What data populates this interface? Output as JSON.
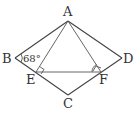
{
  "figure": {
    "type": "geometry-diagram",
    "points": {
      "A": {
        "label": "A",
        "x": 68,
        "y": 21
      },
      "B": {
        "label": "B",
        "x": 15,
        "y": 58
      },
      "C": {
        "label": "C",
        "x": 68,
        "y": 95
      },
      "D": {
        "label": "D",
        "x": 122,
        "y": 58
      },
      "E": {
        "label": "E",
        "x": 36,
        "y": 72
      },
      "F": {
        "label": "F",
        "x": 101,
        "y": 72
      }
    },
    "angle_label": "68°",
    "right_angles": [
      "E",
      "F"
    ]
  }
}
